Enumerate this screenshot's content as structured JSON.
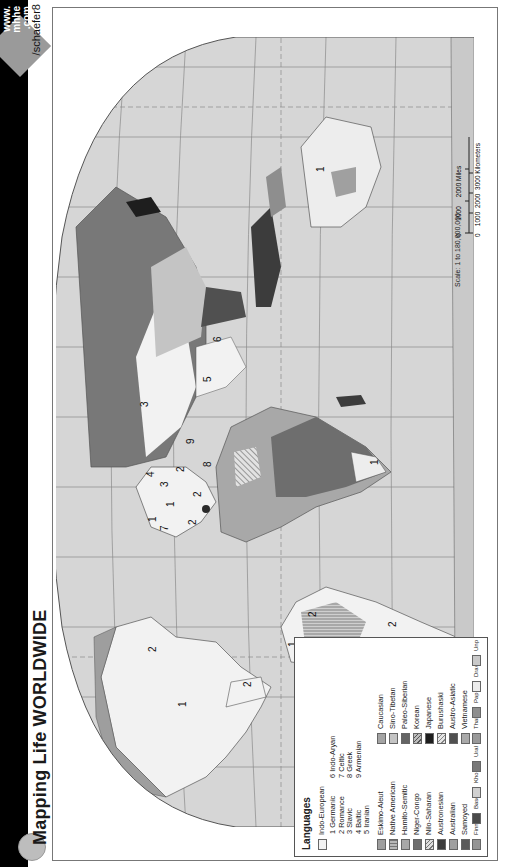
{
  "header": {
    "title": "Mapping Life WORLDWIDE",
    "url_badge": {
      "line1": "www.",
      "line2": "mhhe",
      "line3": ".com",
      "path": "/schaefer8"
    }
  },
  "legend": {
    "title": "Languages",
    "indo_european": {
      "label": "Indo-European",
      "color": "#f2f2f2",
      "subgroups": [
        {
          "num": "1",
          "name": "Germanic"
        },
        {
          "num": "2",
          "name": "Romance"
        },
        {
          "num": "3",
          "name": "Slavic"
        },
        {
          "num": "4",
          "name": "Baltic"
        },
        {
          "num": "5",
          "name": "Iranian"
        },
        {
          "num": "6",
          "name": "Indo-Aryan"
        },
        {
          "num": "7",
          "name": "Celtic"
        },
        {
          "num": "8",
          "name": "Greek"
        },
        {
          "num": "9",
          "name": "Armenian"
        }
      ]
    },
    "left_column": [
      {
        "label": "Eskimo-Aleut",
        "color": "#9e9e9e",
        "pattern": "solid"
      },
      {
        "label": "Native American",
        "color": "#b8b8b8",
        "pattern": "grid"
      },
      {
        "label": "Hamito-Semitic",
        "color": "#a8a8a8",
        "pattern": "solid"
      },
      {
        "label": "Niger-Congo",
        "color": "#6e6e6e",
        "pattern": "solid"
      },
      {
        "label": "Nilo-Saharan",
        "color": "#c8c8c8",
        "pattern": "hatch"
      },
      {
        "label": "Austronesian",
        "color": "#3c3c3c",
        "pattern": "solid"
      },
      {
        "label": "Australian",
        "color": "#a0a0a0",
        "pattern": "solid"
      },
      {
        "label": "Samoyed",
        "color": "#5a5a5a",
        "pattern": "solid"
      },
      {
        "label": "Finno-Ugric",
        "color": "#959595",
        "pattern": "solid"
      },
      {
        "label": "Basque",
        "color": "#4a4a4a",
        "pattern": "solid"
      },
      {
        "label": "Khoisan",
        "color": "#d0d0d0",
        "pattern": "hatch"
      },
      {
        "label": "Ural-Altaic",
        "color": "#787878",
        "pattern": "solid"
      }
    ],
    "right_column": [
      {
        "label": "Caucasian",
        "color": "#a4a4a4",
        "pattern": "solid"
      },
      {
        "label": "Sino-Tibetan",
        "color": "#c4c4c4",
        "pattern": "solid"
      },
      {
        "label": "Paleo-Siberian",
        "color": "#646464",
        "pattern": "solid"
      },
      {
        "label": "Korean",
        "color": "#bdbdbd",
        "pattern": "hatch"
      },
      {
        "label": "Japanese",
        "color": "#1e1e1e",
        "pattern": "solid"
      },
      {
        "label": "Burushaski",
        "color": "#d8d8d8",
        "pattern": "hatch"
      },
      {
        "label": "Austro-Asiatic",
        "color": "#505050",
        "pattern": "solid"
      },
      {
        "label": "Vietnamese",
        "color": "#a9a9a9",
        "pattern": "solid"
      },
      {
        "label": "Thai-Kadai",
        "color": "#999999",
        "pattern": "lines"
      },
      {
        "label": "Papuan",
        "color": "#8e8e8e",
        "pattern": "solid"
      },
      {
        "label": "Dravidian",
        "color": "#ececec",
        "pattern": "diag"
      },
      {
        "label": "Unpopulated Regions",
        "color": "#c9c9c9",
        "pattern": "solid"
      }
    ]
  },
  "scale": {
    "label": "Scale: 1 to 180,000,000",
    "miles_ticks": [
      "0",
      "1000",
      "2000 Miles"
    ],
    "km_ticks": [
      "0",
      "1000",
      "2000",
      "3000 Kilometers"
    ]
  },
  "map_labels": [
    {
      "text": "1",
      "region": "north-america"
    },
    {
      "text": "2",
      "region": "quebec"
    },
    {
      "text": "2",
      "region": "mexico"
    },
    {
      "text": "2",
      "region": "south-america-north"
    },
    {
      "text": "2",
      "region": "south-america-south"
    },
    {
      "text": "1",
      "region": "guyana"
    },
    {
      "text": "1",
      "region": "british-isles"
    },
    {
      "text": "7",
      "region": "ireland"
    },
    {
      "text": "2",
      "region": "iberia"
    },
    {
      "text": "1",
      "region": "germany"
    },
    {
      "text": "2",
      "region": "italy"
    },
    {
      "text": "3",
      "region": "poland"
    },
    {
      "text": "4",
      "region": "baltics"
    },
    {
      "text": "2",
      "region": "romania"
    },
    {
      "text": "8",
      "region": "greece"
    },
    {
      "text": "9",
      "region": "armenia"
    },
    {
      "text": "3",
      "region": "russia"
    },
    {
      "text": "5",
      "region": "iran"
    },
    {
      "text": "6",
      "region": "india"
    },
    {
      "text": "1",
      "region": "south-africa"
    },
    {
      "text": "1",
      "region": "australia"
    }
  ],
  "colors": {
    "ocean": "#d6d6d6",
    "graticule": "#8a8a8a",
    "coast": "#555555",
    "band": "#000000"
  }
}
